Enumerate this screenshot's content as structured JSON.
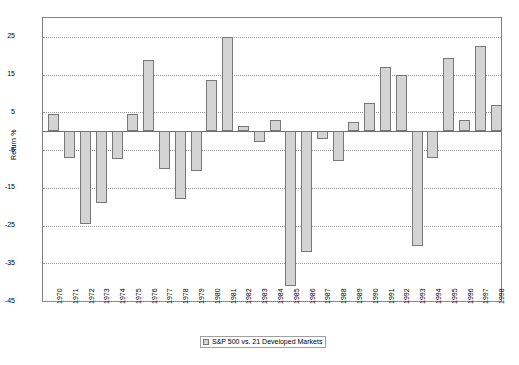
{
  "chart_data": {
    "type": "bar",
    "title": "",
    "subtitle": "",
    "xlabel": "",
    "ylabel": "Return %",
    "ylim": [
      -45,
      30
    ],
    "yticks": [
      25,
      15,
      5,
      -5,
      -15,
      -25,
      -35,
      -45
    ],
    "ytick_labels": [
      "25",
      "15",
      "5",
      "-5",
      "-15",
      "-25",
      "-35",
      "-45"
    ],
    "grid": true,
    "legend_position": "bottom-center",
    "legend": [
      "S&P 500 vs. 21 Developed Markets"
    ],
    "bar_fill": "#d4d4d4",
    "bar_stroke": "#777777",
    "categories": [
      "1970",
      "1971",
      "1972",
      "1973",
      "1974",
      "1975",
      "1976",
      "1977",
      "1978",
      "1979",
      "1980",
      "1981",
      "1982",
      "1983",
      "1984",
      "1985",
      "1986",
      "1987",
      "1988",
      "1989",
      "1990",
      "1991",
      "1992",
      "1993",
      "1994",
      "1995",
      "1996",
      "1997",
      "1998"
    ],
    "series": [
      {
        "name": "S&P 500 vs. 21 Developed Markets",
        "values": [
          4.5,
          -7.0,
          -24.5,
          -19.0,
          -7.5,
          4.5,
          19.0,
          -10.0,
          -18.0,
          -10.5,
          13.5,
          25.0,
          1.5,
          -3.0,
          3.0,
          -41.0,
          -32.0,
          -2.0,
          -8.0,
          2.5,
          7.5,
          17.0,
          15.0,
          -30.5,
          -7.0,
          19.5,
          3.0,
          22.5,
          7.0
        ]
      }
    ]
  },
  "axis": {
    "ylabel": "Return %"
  },
  "legend": {
    "items": [
      {
        "label": "S&P 500 vs. 21 Developed Markets",
        "color": "#d4d4d4"
      }
    ]
  }
}
